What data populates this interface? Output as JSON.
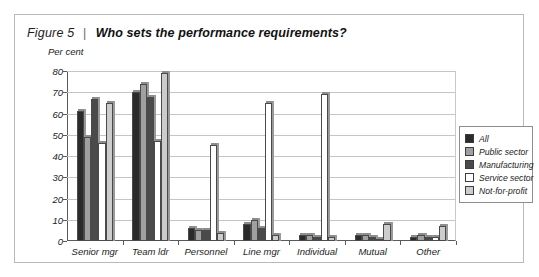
{
  "figure": {
    "number": "Figure 5",
    "separator": "|",
    "title": "Who sets the performance requirements?"
  },
  "chart_data": {
    "type": "bar",
    "title": "Who sets the performance requirements?",
    "xlabel": "",
    "ylabel": "Per cent",
    "ylim": [
      0,
      80
    ],
    "yticks": [
      "0",
      "10",
      "20",
      "30",
      "40",
      "50",
      "60",
      "70",
      "80"
    ],
    "grid": true,
    "legend_position": "right",
    "categories": [
      "Senior mgr",
      "Team ldr",
      "Personnel",
      "Line mgr",
      "Individual",
      "Mutual",
      "Other"
    ],
    "series": [
      {
        "name": "All",
        "color": "#2b2b2b",
        "values": [
          61,
          70,
          6,
          8,
          3,
          3,
          2
        ]
      },
      {
        "name": "Public sector",
        "color": "#a0a0a0",
        "values": [
          49,
          74,
          5,
          10,
          3,
          3,
          3
        ]
      },
      {
        "name": "Manufacturing",
        "color": "#4a4a4a",
        "values": [
          67,
          68,
          5,
          6,
          2,
          2,
          2
        ]
      },
      {
        "name": "Service sector",
        "color": "#ffffff",
        "values": [
          46,
          47,
          45,
          65,
          69,
          1,
          2
        ]
      },
      {
        "name": "Not-for-profit",
        "color": "#cccccc",
        "values": [
          65,
          79,
          4,
          3,
          2,
          8,
          7
        ]
      }
    ]
  },
  "legend": {
    "items": [
      {
        "label": "All"
      },
      {
        "label": "Public sector"
      },
      {
        "label": "Manufacturing"
      },
      {
        "label": "Service sector"
      },
      {
        "label": "Not-for-profit"
      }
    ]
  }
}
